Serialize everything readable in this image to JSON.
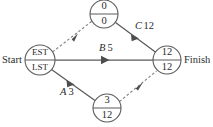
{
  "diagram": {
    "type": "activity-on-arrow-network",
    "terminals": {
      "start_label": "Start",
      "finish_label": "Finish"
    },
    "nodes": [
      {
        "id": "start-node",
        "name": "start-node",
        "top_value": "EST",
        "bottom_value": "LST",
        "cx": 40,
        "cy": 60,
        "r": 15,
        "text_size": "small"
      },
      {
        "id": "top-node",
        "name": "top-node",
        "top_value": "0",
        "bottom_value": "0",
        "cx": 104,
        "cy": 14,
        "r": 14,
        "text_size": "normal"
      },
      {
        "id": "bottom-node",
        "name": "bottom-node",
        "top_value": "3",
        "bottom_value": "12",
        "cx": 107,
        "cy": 108,
        "r": 14,
        "text_size": "normal"
      },
      {
        "id": "finish-node",
        "name": "finish-node",
        "top_value": "12",
        "bottom_value": "12",
        "cx": 167,
        "cy": 60,
        "r": 14,
        "text_size": "normal"
      }
    ],
    "edges": [
      {
        "id": "edge-start-to-top",
        "name": "edge-start-to-top-dummy",
        "style": "dashed",
        "from": "start-node",
        "to": "top-node",
        "label_letter": "",
        "label_duration": ""
      },
      {
        "id": "edge-top-to-finish",
        "name": "edge-top-to-finish-activity-c",
        "style": "solid",
        "from": "top-node",
        "to": "finish-node",
        "label_letter": "C",
        "label_duration": "12"
      },
      {
        "id": "edge-start-to-finish",
        "name": "edge-start-to-finish-activity-b",
        "style": "solid",
        "from": "start-node",
        "to": "finish-node",
        "label_letter": "B",
        "label_duration": "5"
      },
      {
        "id": "edge-start-to-bottom",
        "name": "edge-start-to-bottom-activity-a",
        "style": "solid",
        "from": "start-node",
        "to": "bottom-node",
        "label_letter": "A",
        "label_duration": "3"
      },
      {
        "id": "edge-bottom-to-finish",
        "name": "edge-bottom-to-finish-dummy",
        "style": "dashed",
        "from": "bottom-node",
        "to": "finish-node",
        "label_letter": "",
        "label_duration": ""
      }
    ],
    "labels": {
      "c_letter": "C",
      "c_duration": "12",
      "b_letter": "B",
      "b_duration": "5",
      "a_letter": "A",
      "a_duration": "3"
    },
    "colors": {
      "stroke": "#5a5a5a",
      "dashed_stroke": "#7d7d7d",
      "text": "#2b2b2b",
      "background": "#ffffff"
    }
  }
}
